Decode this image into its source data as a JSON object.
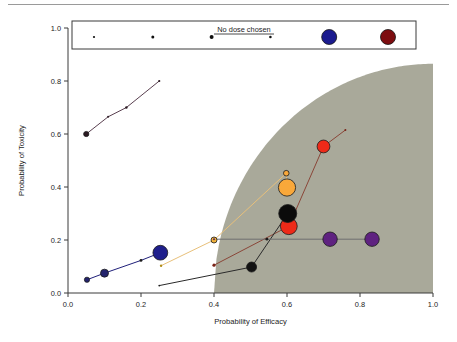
{
  "chart_data": {
    "type": "scatter",
    "title": "",
    "xlabel": "Probability of Efficacy",
    "ylabel": "Probability of Toxicity",
    "xlim": [
      0.0,
      1.0
    ],
    "ylim": [
      0.0,
      1.0
    ],
    "xticks": [
      "0.0",
      "0.2",
      "0.4",
      "0.6",
      "0.8",
      "1.0"
    ],
    "yticks": [
      "0.0",
      "0.2",
      "0.4",
      "0.6",
      "0.8",
      "1.0"
    ],
    "grid": false,
    "legend": {
      "position": "top",
      "title": "No dose chosen",
      "note": "Dot size encodes selection frequency; colors denote dose levels",
      "items": [
        {
          "name": "dose-1",
          "color": "#101010",
          "radius": 1.1
        },
        {
          "name": "dose-2",
          "color": "#101010",
          "radius": 1.5
        },
        {
          "name": "dose-3",
          "color": "#101010",
          "radius": 2.0
        },
        {
          "name": "dose-4",
          "color": "#101010",
          "radius": 1.3
        },
        {
          "name": "dose-5",
          "color": "#1b1b8f",
          "radius": 7.5
        },
        {
          "name": "dose-6",
          "color": "#7d0d10",
          "radius": 7.5
        }
      ]
    },
    "shaded_region": {
      "label": "acceptable-region",
      "fill": "#a9a99a",
      "x_start": 0.4,
      "description": "Shaded desirability region bounded by a concave curve rising from (0.40, 0.0) to (1.0, 0.86)"
    },
    "series": [
      {
        "name": "upper-curve",
        "color": "#5a4050",
        "line": true,
        "points": [
          {
            "x": 0.05,
            "y": 0.6,
            "r": 2.6,
            "color": "#2b1a22"
          },
          {
            "x": 0.11,
            "y": 0.665,
            "r": 1.0,
            "color": "#2b1a22"
          },
          {
            "x": 0.16,
            "y": 0.7,
            "r": 1.2,
            "color": "#2b1a22"
          },
          {
            "x": 0.25,
            "y": 0.8,
            "r": 1.1,
            "color": "#2b1a22"
          }
        ]
      },
      {
        "name": "blue-series",
        "color": "#20207a",
        "line": true,
        "points": [
          {
            "x": 0.052,
            "y": 0.05,
            "r": 2.6,
            "color": "#23236d"
          },
          {
            "x": 0.1,
            "y": 0.075,
            "r": 4.0,
            "color": "#23236d"
          },
          {
            "x": 0.2,
            "y": 0.123,
            "r": 1.4,
            "color": "#1c1c1c"
          },
          {
            "x": 0.253,
            "y": 0.152,
            "r": 7.4,
            "color": "#1f1f8c"
          }
        ]
      },
      {
        "name": "orange-series",
        "color": "#e8c07a",
        "line": true,
        "points": [
          {
            "x": 0.255,
            "y": 0.103,
            "r": 1.2,
            "color": "#b08c18"
          },
          {
            "x": 0.4,
            "y": 0.2,
            "r": 3.0,
            "color": "#f2b33a"
          },
          {
            "x": 0.598,
            "y": 0.452,
            "r": 2.8,
            "color": "#f9a83a"
          },
          {
            "x": 0.6,
            "y": 0.398,
            "r": 8.6,
            "color": "#f9a83a"
          }
        ]
      },
      {
        "name": "darkred-series",
        "color": "#8a4638",
        "line": true,
        "points": [
          {
            "x": 0.4,
            "y": 0.105,
            "r": 1.6,
            "color": "#7a2418"
          },
          {
            "x": 0.605,
            "y": 0.252,
            "r": 8.4,
            "color": "#ee2a18"
          },
          {
            "x": 0.7,
            "y": 0.553,
            "r": 6.4,
            "color": "#ee2a18"
          },
          {
            "x": 0.76,
            "y": 0.615,
            "r": 1.0,
            "color": "#7a2418"
          }
        ]
      },
      {
        "name": "black-series",
        "color": "#2a2a2a",
        "line": true,
        "points": [
          {
            "x": 0.25,
            "y": 0.028,
            "r": 0.9,
            "color": "#1c1c1c"
          },
          {
            "x": 0.503,
            "y": 0.098,
            "r": 5.0,
            "color": "#121212"
          },
          {
            "x": 0.602,
            "y": 0.3,
            "r": 9.0,
            "color": "#0b0b0b"
          }
        ]
      },
      {
        "name": "purple-series",
        "color": "#6f6f6f",
        "line": true,
        "points": [
          {
            "x": 0.4,
            "y": 0.203,
            "r": 1.0,
            "color": "#5a2a5a"
          },
          {
            "x": 0.545,
            "y": 0.203,
            "r": 1.4,
            "color": "#1c1c1c"
          },
          {
            "x": 0.718,
            "y": 0.203,
            "r": 7.2,
            "color": "#5f2280"
          },
          {
            "x": 0.833,
            "y": 0.203,
            "r": 7.2,
            "color": "#5f2280"
          }
        ]
      }
    ]
  }
}
